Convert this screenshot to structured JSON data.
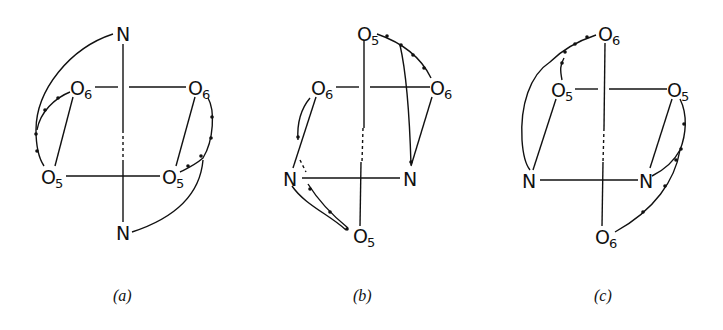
{
  "figure": {
    "panels": [
      {
        "caption": "(a)",
        "atoms": [
          {
            "id": "N_top",
            "element": "O",
            "label": "N",
            "sub": ""
          },
          {
            "id": "O6_left",
            "label": "O",
            "sub": "6"
          },
          {
            "id": "O6_right",
            "label": "O",
            "sub": "6"
          },
          {
            "id": "O5_left",
            "label": "O",
            "sub": "5"
          },
          {
            "id": "O5_right",
            "label": "O",
            "sub": "5"
          },
          {
            "id": "N_bottom",
            "label": "N",
            "sub": ""
          }
        ]
      },
      {
        "caption": "(b)",
        "atoms": [
          {
            "id": "O5_top",
            "label": "O",
            "sub": "5"
          },
          {
            "id": "O6_left",
            "label": "O",
            "sub": "6"
          },
          {
            "id": "O6_right",
            "label": "O",
            "sub": "6"
          },
          {
            "id": "N_left",
            "label": "N",
            "sub": ""
          },
          {
            "id": "N_right",
            "label": "N",
            "sub": ""
          },
          {
            "id": "O5_bottom",
            "label": "O",
            "sub": "5"
          }
        ]
      },
      {
        "caption": "(c)",
        "atoms": [
          {
            "id": "O6_top",
            "label": "O",
            "sub": "6"
          },
          {
            "id": "O5_left",
            "label": "O",
            "sub": "5"
          },
          {
            "id": "O5_right",
            "label": "O",
            "sub": "5"
          },
          {
            "id": "N_left",
            "label": "N",
            "sub": ""
          },
          {
            "id": "N_right",
            "label": "N",
            "sub": ""
          },
          {
            "id": "O6_bottom",
            "label": "O",
            "sub": "6"
          }
        ]
      }
    ]
  }
}
